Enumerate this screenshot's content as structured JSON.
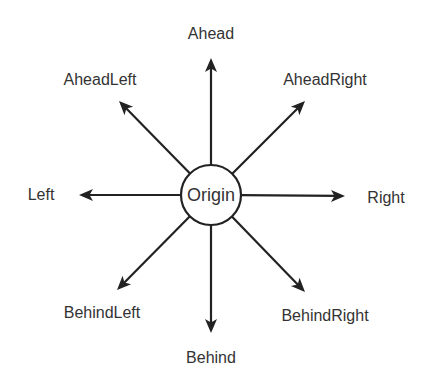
{
  "diagram": {
    "origin": {
      "label": "Origin",
      "cx": 211,
      "cy": 195,
      "r": 30
    },
    "stroke_color": "#222222",
    "text_color": "#333333",
    "directions": [
      {
        "key": "ahead",
        "label": "Ahead",
        "tip": [
          211,
          58
        ],
        "label_pos": [
          211,
          34
        ]
      },
      {
        "key": "ahead-right",
        "label": "AheadRight",
        "tip": [
          305,
          101
        ],
        "label_pos": [
          325,
          80
        ]
      },
      {
        "key": "right",
        "label": "Right",
        "tip": [
          345,
          196
        ],
        "label_pos": [
          386,
          198
        ]
      },
      {
        "key": "behind-right",
        "label": "BehindRight",
        "tip": [
          305,
          292
        ],
        "label_pos": [
          325,
          316
        ]
      },
      {
        "key": "behind",
        "label": "Behind",
        "tip": [
          211,
          333
        ],
        "label_pos": [
          211,
          358
        ]
      },
      {
        "key": "behind-left",
        "label": "BehindLeft",
        "tip": [
          117,
          290
        ],
        "label_pos": [
          102,
          313
        ]
      },
      {
        "key": "left",
        "label": "Left",
        "tip": [
          79,
          195
        ],
        "label_pos": [
          41,
          195
        ]
      },
      {
        "key": "ahead-left",
        "label": "AheadLeft",
        "tip": [
          119,
          101
        ],
        "label_pos": [
          100,
          80
        ]
      }
    ]
  }
}
